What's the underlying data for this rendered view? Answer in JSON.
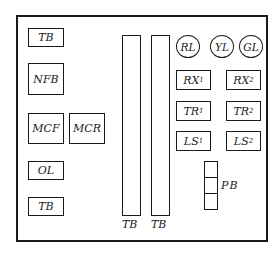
{
  "diagram": {
    "type": "control panel layout",
    "left_column": {
      "tb_top": "TB",
      "nfb": "NFB",
      "mcf": "MCF",
      "mcr": "MCR",
      "ol": "OL",
      "tb_bottom": "TB"
    },
    "terminal_strips": [
      {
        "label": "TB"
      },
      {
        "label": "TB"
      }
    ],
    "lamps": [
      {
        "label": "RL"
      },
      {
        "label": "YL"
      },
      {
        "label": "GL"
      }
    ],
    "components": {
      "rx1": {
        "main": "RX",
        "sub": "1"
      },
      "rx2": {
        "main": "RX",
        "sub": "2"
      },
      "tr1": {
        "main": "TR",
        "sub": "1"
      },
      "tr2": {
        "main": "TR",
        "sub": "2"
      },
      "ls1": {
        "main": "LS",
        "sub": "1"
      },
      "ls2": {
        "main": "LS",
        "sub": "2"
      }
    },
    "push_button": {
      "label": "PB",
      "cells": 3
    }
  }
}
